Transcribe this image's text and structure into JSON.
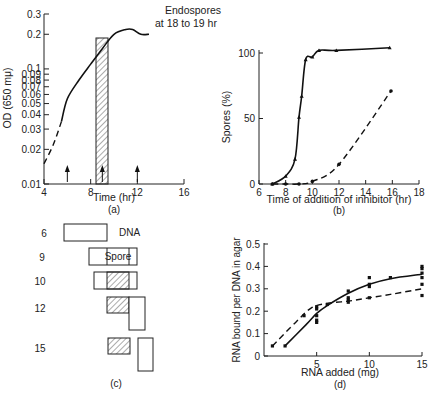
{
  "chart_data": [
    {
      "id": "a",
      "type": "line",
      "caption": "(a)",
      "xlabel": "Time (hr)",
      "ylabel": "OD (650 mμ)",
      "yscale": "log",
      "xlim": [
        4,
        16
      ],
      "ylim": [
        0.01,
        0.3
      ],
      "xticks": [
        4,
        8,
        12,
        16
      ],
      "yticks": [
        "0.01",
        "0.02",
        "0.03",
        "0.04",
        "0.05",
        "0.06",
        "0.07",
        "0.08",
        "0.09",
        "0.1",
        "0.2",
        "0.3"
      ],
      "annotation": [
        "Endospores",
        "at 18 to 19 hr"
      ],
      "arrows_at_hr": [
        6,
        9,
        12
      ],
      "shaded_interval_hr": [
        8.4,
        9.4
      ],
      "shaded_top_od": 0.18,
      "series": [
        {
          "name": "growth (extrapolated)",
          "style": "dashed",
          "x": [
            4.0,
            4.8,
            5.5
          ],
          "y": [
            0.015,
            0.022,
            0.035
          ]
        },
        {
          "name": "growth",
          "style": "solid",
          "x": [
            5.5,
            6.0,
            7.0,
            8.0,
            9.0,
            10.0,
            11.0,
            11.6,
            12.3,
            13.0
          ],
          "y": [
            0.035,
            0.055,
            0.08,
            0.11,
            0.15,
            0.2,
            0.22,
            0.22,
            0.2,
            0.2
          ]
        }
      ],
      "grid": false
    },
    {
      "id": "b",
      "type": "line",
      "caption": "(b)",
      "xlabel": "Time of addition of inhibitor  (hr)",
      "ylabel": "Spores (%)",
      "xlim": [
        6,
        18
      ],
      "ylim": [
        0,
        100
      ],
      "xticks": [
        6,
        8,
        10,
        12,
        14,
        16,
        18
      ],
      "yticks": [
        0,
        50,
        100
      ],
      "series": [
        {
          "name": "inhibitor A (triangles, solid)",
          "style": "solid",
          "marker": "triangle",
          "x": [
            7.0,
            8.0,
            8.7,
            9.0,
            9.2,
            9.5,
            10.0,
            10.5,
            11.8,
            15.8
          ],
          "y": [
            0,
            6,
            19,
            51,
            67,
            95,
            97,
            102,
            102,
            104
          ]
        },
        {
          "name": "inhibitor B (circles, dashed)",
          "style": "dashed",
          "marker": "circle",
          "x": [
            7.0,
            8.0,
            9.0,
            10.0,
            12.0,
            15.9
          ],
          "y": [
            0,
            0,
            0,
            2,
            15,
            71
          ]
        }
      ],
      "grid": false
    },
    {
      "id": "c",
      "type": "diagram",
      "caption": "(c)",
      "rows": [
        {
          "label": "6",
          "text": "DNA"
        },
        {
          "label": "9",
          "text": "Spore"
        },
        {
          "label": "10",
          "text": ""
        },
        {
          "label": "12",
          "text": ""
        },
        {
          "label": "15",
          "text": ""
        }
      ]
    },
    {
      "id": "d",
      "type": "scatter",
      "caption": "(d)",
      "xlabel": "RNA added (mg)",
      "ylabel": "RNA bound per DNA in agar",
      "xlim": [
        0,
        15
      ],
      "ylim": [
        0,
        0.5
      ],
      "xticks": [
        5,
        10,
        15
      ],
      "yticks": [
        0,
        0.1,
        0.2,
        0.3,
        0.4,
        0.5
      ],
      "series": [
        {
          "name": "solid curve",
          "style": "solid",
          "points": [
            [
              2.0,
              0.045
            ],
            [
              5.0,
              0.18
            ],
            [
              5.0,
              0.16
            ],
            [
              5.0,
              0.15
            ],
            [
              6.0,
              0.23
            ],
            [
              8.0,
              0.29
            ],
            [
              8.0,
              0.26
            ],
            [
              10.0,
              0.35
            ],
            [
              10.0,
              0.32
            ],
            [
              10.0,
              0.31
            ],
            [
              12.0,
              0.35
            ],
            [
              15.0,
              0.4
            ],
            [
              15.0,
              0.39
            ],
            [
              15.0,
              0.37
            ],
            [
              15.0,
              0.35
            ],
            [
              15.0,
              0.32
            ]
          ],
          "curve_x": [
            2,
            4,
            5,
            6,
            8,
            10,
            12,
            15
          ],
          "curve_y": [
            0.045,
            0.14,
            0.19,
            0.225,
            0.28,
            0.32,
            0.345,
            0.365
          ]
        },
        {
          "name": "dashed curve",
          "style": "dashed",
          "points": [
            [
              0.8,
              0.045
            ],
            [
              3.8,
              0.18
            ],
            [
              5.0,
              0.22
            ],
            [
              5.0,
              0.21
            ],
            [
              8.0,
              0.25
            ],
            [
              8.0,
              0.24
            ],
            [
              10.0,
              0.26
            ],
            [
              15.0,
              0.27
            ]
          ],
          "curve_x": [
            0.8,
            3,
            4.5,
            6,
            8,
            10,
            12,
            15
          ],
          "curve_y": [
            0.045,
            0.15,
            0.215,
            0.235,
            0.245,
            0.26,
            0.275,
            0.3
          ]
        }
      ],
      "grid": false
    }
  ],
  "panel_a": {
    "caption": "(a)",
    "xlabel": "Time (hr)",
    "ylabel": "OD (650 mμ)",
    "annotation_line1": "Endospores",
    "annotation_line2": "at 18 to 19 hr",
    "xticks": [
      "4",
      "8",
      "12",
      "16"
    ],
    "yticks": [
      "0.3",
      "0.2",
      "0.1",
      "0.09",
      "0.08",
      "0.07",
      "0.06",
      "0.05",
      "0.04",
      "0.03",
      "0.02",
      "0.01"
    ]
  },
  "panel_b": {
    "caption": "(b)",
    "xlabel": "Time of addition of inhibitor  (hr)",
    "ylabel": "Spores (%)",
    "xticks": [
      "6",
      "8",
      "10",
      "12",
      "14",
      "16",
      "18"
    ],
    "yticks": [
      "100",
      "50",
      "0"
    ]
  },
  "panel_c": {
    "caption": "(c)",
    "row_labels": [
      "6",
      "9",
      "10",
      "12",
      "15"
    ],
    "dna_label": "DNA",
    "spore_label": "Spore"
  },
  "panel_d": {
    "caption": "(d)",
    "xlabel": "RNA added (mg)",
    "ylabel": "RNA bound per DNA in agar",
    "xticks": [
      "5",
      "10",
      "15"
    ],
    "yticks": [
      "0.5",
      "0.4",
      "0.3",
      "0.2",
      "0.1",
      "0"
    ]
  }
}
